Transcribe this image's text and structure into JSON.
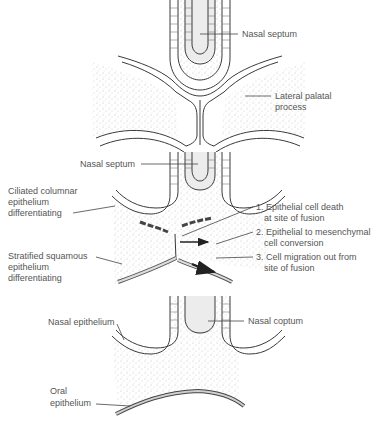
{
  "panels": [
    {
      "id": "panel-1",
      "labels": {
        "nasal_septum": "Nasal septum",
        "lateral_palatal_line1": "Lateral palatal",
        "lateral_palatal_line2": "process"
      }
    },
    {
      "id": "panel-2",
      "labels": {
        "nasal_septum": "Nasal septum",
        "ciliated_line1": "Ciliated columnar",
        "ciliated_line2": "epithelium",
        "ciliated_line3": "differentiating",
        "stratified_line1": "Stratified squamous",
        "stratified_line2": "epithelium",
        "stratified_line3": "differentiating",
        "step1_line1": "1. Epithelial cell death",
        "step1_line2": "at site of fusion",
        "step2_line1": "2. Epithelial to mesenchymal",
        "step2_line2": "cell conversion",
        "step3_line1": "3. Cell migration out from",
        "step3_line2": "site of fusion"
      }
    },
    {
      "id": "panel-3",
      "labels": {
        "nasal_epithelium": "Nasal epithelium",
        "nasal_septum": "Nasal coptum",
        "oral_line1": "Oral",
        "oral_line2": "epithelium"
      }
    }
  ],
  "colors": {
    "line": "#333333",
    "text": "#555555",
    "stipple": "#9a9a9a",
    "septum_fill": "#e6e6e6",
    "arrow": "#222222"
  }
}
